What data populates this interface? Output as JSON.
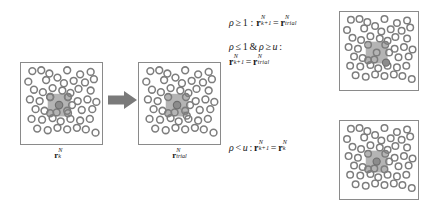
{
  "figure": {
    "type": "monte-carlo-metropolis-diagram",
    "background_color": "#ffffff",
    "ink_color": "#1a1a1a",
    "box_border_color": "#8a8a8a",
    "particle_outline_color": "#7d7d7d",
    "highlight_square_color": "#b4b4b4",
    "selected_particle_color": "#8c8c8c",
    "moved_particle_color": "#6e6e6e",
    "arrow_color": "#7a7a7a"
  },
  "boxes": {
    "initial": {
      "name": "initial-configuration",
      "label_text": "r",
      "label_sub": "k",
      "label_sup": "N"
    },
    "trial": {
      "name": "trial-configuration",
      "label_text": "r",
      "label_sub": "trial",
      "label_sup": "N"
    },
    "accepted": {
      "name": "accepted-configuration",
      "label_text": "",
      "label_sub": "",
      "label_sup": ""
    },
    "rejected": {
      "name": "rejected-configuration",
      "label_text": "",
      "label_sub": "",
      "label_sup": ""
    }
  },
  "equations": {
    "accept_certain": {
      "condition_rho": "ρ",
      "condition_rel": "≥",
      "condition_value": "1",
      "colon": " : ",
      "lhs_base": "r",
      "lhs_sub": "k+1",
      "lhs_sup": "N",
      "equals": "=",
      "rhs_base": "r",
      "rhs_sub": "trial",
      "rhs_sup": "N",
      "full_text": "ρ ≥ 1 : r_{k+1}^N = r_{trial}^N"
    },
    "accept_probabilistic": {
      "cond_line": "ρ ≤ 1 & ρ ≥ u :",
      "cond_rho1": "ρ",
      "cond_rel1": "≤",
      "cond_val1": "1",
      "cond_amp": "&",
      "cond_rho2": "ρ",
      "cond_rel2": "≥",
      "cond_val2": "u",
      "cond_colon": ":",
      "lhs_base": "r",
      "lhs_sub": "k+1",
      "lhs_sup": "N",
      "equals": "=",
      "rhs_base": "r",
      "rhs_sub": "trial",
      "rhs_sup": "N",
      "full_text": "ρ ≤ 1 & ρ ≥ u : r_{k+1}^N = r_{trial}^N"
    },
    "reject": {
      "cond_rho": "ρ",
      "cond_rel": "<",
      "cond_val": "u",
      "colon": ":",
      "lhs_base": "r",
      "lhs_sub": "k+1",
      "lhs_sup": "N",
      "equals": "=",
      "rhs_base": "r",
      "rhs_sub": "k",
      "rhs_sup": "N",
      "full_text": "ρ < u: r_{k+1}^N = r_k^N"
    }
  },
  "particles": {
    "initial": [
      [
        14,
        10
      ],
      [
        24,
        9
      ],
      [
        34,
        12
      ],
      [
        56,
        9
      ],
      [
        72,
        13
      ],
      [
        84,
        11
      ],
      [
        10,
        22
      ],
      [
        30,
        20
      ],
      [
        44,
        18
      ],
      [
        52,
        24
      ],
      [
        64,
        21
      ],
      [
        78,
        23
      ],
      [
        88,
        19
      ],
      [
        16,
        32
      ],
      [
        26,
        35
      ],
      [
        38,
        30
      ],
      [
        50,
        33
      ],
      [
        60,
        36
      ],
      [
        70,
        31
      ],
      [
        84,
        33
      ],
      [
        12,
        44
      ],
      [
        22,
        46
      ],
      [
        34,
        44
      ],
      [
        46,
        47
      ],
      [
        58,
        44
      ],
      [
        68,
        46
      ],
      [
        80,
        45
      ],
      [
        18,
        56
      ],
      [
        28,
        58
      ],
      [
        40,
        56
      ],
      [
        52,
        58
      ],
      [
        62,
        55
      ],
      [
        74,
        57
      ],
      [
        86,
        56
      ],
      [
        14,
        68
      ],
      [
        26,
        69
      ],
      [
        38,
        67
      ],
      [
        48,
        70
      ],
      [
        60,
        68
      ],
      [
        72,
        70
      ],
      [
        84,
        68
      ],
      [
        20,
        79
      ],
      [
        32,
        81
      ],
      [
        44,
        79
      ],
      [
        56,
        81
      ],
      [
        68,
        79
      ],
      [
        80,
        81
      ],
      [
        90,
        84
      ]
    ],
    "trial": [
      [
        14,
        10
      ],
      [
        24,
        9
      ],
      [
        34,
        12
      ],
      [
        56,
        9
      ],
      [
        72,
        13
      ],
      [
        84,
        11
      ],
      [
        10,
        22
      ],
      [
        30,
        20
      ],
      [
        44,
        18
      ],
      [
        52,
        24
      ],
      [
        64,
        21
      ],
      [
        78,
        23
      ],
      [
        88,
        19
      ],
      [
        16,
        32
      ],
      [
        26,
        35
      ],
      [
        38,
        30
      ],
      [
        50,
        33
      ],
      [
        60,
        36
      ],
      [
        70,
        31
      ],
      [
        84,
        33
      ],
      [
        12,
        44
      ],
      [
        22,
        46
      ],
      [
        34,
        44
      ],
      [
        46,
        47
      ],
      [
        58,
        44
      ],
      [
        68,
        46
      ],
      [
        80,
        45
      ],
      [
        18,
        56
      ],
      [
        28,
        58
      ],
      [
        40,
        56
      ],
      [
        52,
        58
      ],
      [
        62,
        55
      ],
      [
        74,
        57
      ],
      [
        86,
        56
      ],
      [
        14,
        68
      ],
      [
        26,
        69
      ],
      [
        38,
        67
      ],
      [
        48,
        70
      ],
      [
        60,
        68
      ],
      [
        72,
        70
      ],
      [
        84,
        68
      ],
      [
        20,
        79
      ],
      [
        32,
        81
      ],
      [
        44,
        79
      ],
      [
        56,
        81
      ],
      [
        68,
        79
      ],
      [
        80,
        81
      ],
      [
        90,
        84
      ]
    ]
  },
  "layout_note": "4 periodic-boundary simulation cells, one grey transition arrow, three Metropolis acceptance-criterion equations"
}
